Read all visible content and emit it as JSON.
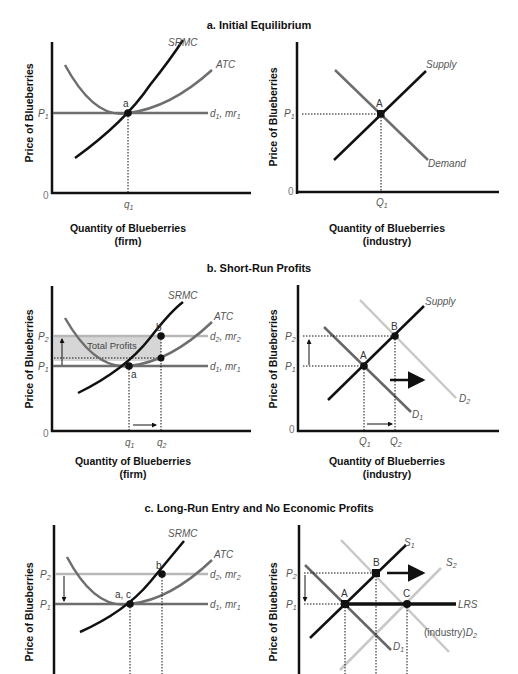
{
  "colors": {
    "axis": "#111111",
    "srmc": "#111111",
    "atc": "#6e6e6e",
    "price_line_1": "#6e6e6e",
    "price_line_2": "#b8b8b8",
    "demand_1": "#666666",
    "demand_2": "#c8c8c8",
    "supply_2": "#c8c8c8",
    "profit_fill": "#d6d6d6"
  },
  "panels": {
    "a": {
      "title": "a. Initial Equilibrium",
      "firm": {
        "ylabel": "Price of Blueberries",
        "xlabel": "Quantity of Blueberries",
        "xlabel2": "(firm)",
        "zero": "0",
        "price_tick": "P",
        "price_sub": "1",
        "qty_tick": "q",
        "qty_sub": "1",
        "curve_srmc": "SRMC",
        "curve_atc": "ATC",
        "curve_d": "d",
        "curve_d_sub": "1",
        "curve_mr": "mr",
        "curve_mr_sub": "1",
        "point": "a"
      },
      "industry": {
        "ylabel": "Price of Blueberries",
        "xlabel": "Quantity of Blueberries",
        "xlabel2": "(industry)",
        "zero": "0",
        "price_tick": "P",
        "price_sub": "1",
        "qty_tick": "Q",
        "qty_sub": "1",
        "curve_supply": "Supply",
        "curve_demand": "Demand",
        "point": "A"
      }
    },
    "b": {
      "title": "b. Short-Run Profits",
      "firm": {
        "ylabel": "Price of Blueberries",
        "xlabel": "Quantity of Blueberries",
        "xlabel2": "(firm)",
        "zero": "0",
        "p1": "P",
        "p1_sub": "1",
        "p2": "P",
        "p2_sub": "2",
        "q1": "q",
        "q1_sub": "1",
        "q2": "q",
        "q2_sub": "2",
        "curve_srmc": "SRMC",
        "curve_atc": "ATC",
        "d2": "d",
        "d2_sub": "2",
        "mr2": "mr",
        "mr2_sub": "2",
        "d1": "d",
        "d1_sub": "1",
        "mr1": "mr",
        "mr1_sub": "1",
        "area_label": "Total Profits",
        "point_a": "a",
        "point_b": "b"
      },
      "industry": {
        "ylabel": "Price of Blueberries",
        "xlabel": "Quantity of Blueberries",
        "xlabel2": "(industry)",
        "zero": "0",
        "p1": "P",
        "p1_sub": "1",
        "p2": "P",
        "p2_sub": "2",
        "q1": "Q",
        "q1_sub": "1",
        "q2": "Q",
        "q2_sub": "2",
        "curve_supply": "Supply",
        "d1": "D",
        "d1_sub": "1",
        "d2": "D",
        "d2_sub": "2",
        "point_a": "A",
        "point_b": "B"
      }
    },
    "c": {
      "title": "c. Long-Run Entry and No Economic Profits",
      "firm": {
        "ylabel": "Price of Blueberries",
        "p1": "P",
        "p1_sub": "1",
        "p2": "P",
        "p2_sub": "2",
        "curve_srmc": "SRMC",
        "curve_atc": "ATC",
        "d2": "d",
        "d2_sub": "2",
        "mr2": "mr",
        "mr2_sub": "2",
        "d1": "d",
        "d1_sub": "1",
        "mr1": "mr",
        "mr1_sub": "1",
        "point_ac": "a, c",
        "point_b": "b"
      },
      "industry": {
        "ylabel": "Price of Blueberries",
        "p1": "P",
        "p1_sub": "1",
        "p2": "P",
        "p2_sub": "2",
        "s1": "S",
        "s1_sub": "1",
        "s2": "S",
        "s2_sub": "2",
        "lrs": "LRS",
        "d1": "D",
        "d1_sub": "1",
        "d2_prefix": "(industry)",
        "d2": "D",
        "d2_sub": "2",
        "point_a": "A",
        "point_b": "B",
        "point_c": "C"
      }
    }
  }
}
